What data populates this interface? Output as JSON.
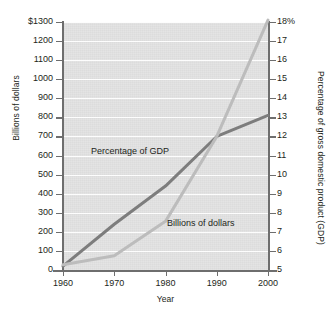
{
  "chart_data": {
    "type": "line",
    "title": "",
    "xlabel": "Year",
    "ylabel": "Billions of dollars",
    "y2label": "Percentage of gross domestic product (GDP)",
    "x": [
      1960,
      1970,
      1980,
      1990,
      2000
    ],
    "xtick_labels": [
      "1960",
      "1970",
      "1980",
      "1990",
      "2000"
    ],
    "ylim": [
      0,
      1300
    ],
    "ytick_labels": [
      "$1300",
      "1200",
      "1100",
      "1000",
      "900",
      "800",
      "700",
      "600",
      "500",
      "400",
      "300",
      "200",
      "100",
      "0"
    ],
    "ytick_values": [
      1300,
      1200,
      1100,
      1000,
      900,
      800,
      700,
      600,
      500,
      400,
      300,
      200,
      100,
      0
    ],
    "y2lim": [
      5,
      18
    ],
    "y2tick_labels": [
      "18%",
      "17",
      "16",
      "15",
      "14",
      "13",
      "12",
      "11",
      "10",
      "9",
      "8",
      "7",
      "6",
      "5"
    ],
    "y2tick_values": [
      18,
      17,
      16,
      15,
      14,
      13,
      12,
      11,
      10,
      9,
      8,
      7,
      6,
      5
    ],
    "grid": true,
    "legend": "inline-annotations",
    "plot_background": "#e2e2e2",
    "gridline_color": "#fdfdfd",
    "series": [
      {
        "name": "Percentage of GDP",
        "axis": "right",
        "color": "#7d7d7d",
        "unit": "%",
        "values": [
          5.2,
          7.4,
          9.4,
          12.0,
          13.1
        ]
      },
      {
        "name": "Billions of dollars",
        "axis": "left",
        "color": "#bcbcbc",
        "unit": "billions of dollars",
        "values": [
          27,
          75,
          255,
          700,
          1310
        ]
      }
    ],
    "annotations": [
      {
        "text": "Percentage of GDP",
        "series": "Percentage of GDP"
      },
      {
        "text": "Billions of dollars",
        "series": "Billions of dollars"
      }
    ]
  }
}
